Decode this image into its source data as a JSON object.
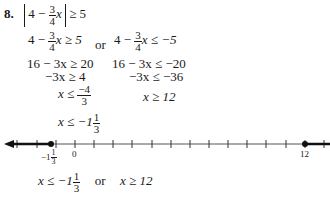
{
  "problem": {
    "number": "8.",
    "statement": {
      "lhs_const": "4 −",
      "frac_num": "3",
      "frac_den": "4",
      "var": "x",
      "rel": "≥ 5"
    }
  },
  "steps": {
    "left": {
      "line1": {
        "pre": "4 −",
        "frac_num": "3",
        "frac_den": "4",
        "post": "x ≥ 5"
      },
      "line2": "16 − 3x ≥ 20",
      "line3": "−3x ≥ 4",
      "line4": {
        "pre": "x ≤",
        "frac_num": "−4",
        "frac_den": "3"
      },
      "line5": {
        "pre": "x ≤ −1",
        "frac_num": "1",
        "frac_den": "3"
      }
    },
    "connector": "or",
    "right": {
      "line1": {
        "pre": "4 −",
        "frac_num": "3",
        "frac_den": "4",
        "post": "x ≤ −5"
      },
      "line2": "16 − 3x ≤ −20",
      "line3": "−3x ≤ −36",
      "line4": "x ≥ 12"
    }
  },
  "number_line": {
    "labels": {
      "left_point_whole": "−1",
      "left_point_num": "1",
      "left_point_den": "3",
      "zero": "0",
      "right_point": "12"
    },
    "shaded": [
      "x ≤ −1 1/3",
      "x ≥ 12"
    ],
    "closed_points": [
      "−1 1/3",
      "12"
    ]
  },
  "answer": {
    "pre": "x ≤ −1",
    "frac_num": "1",
    "frac_den": "3",
    "connector": "or",
    "post": "x ≥ 12"
  }
}
